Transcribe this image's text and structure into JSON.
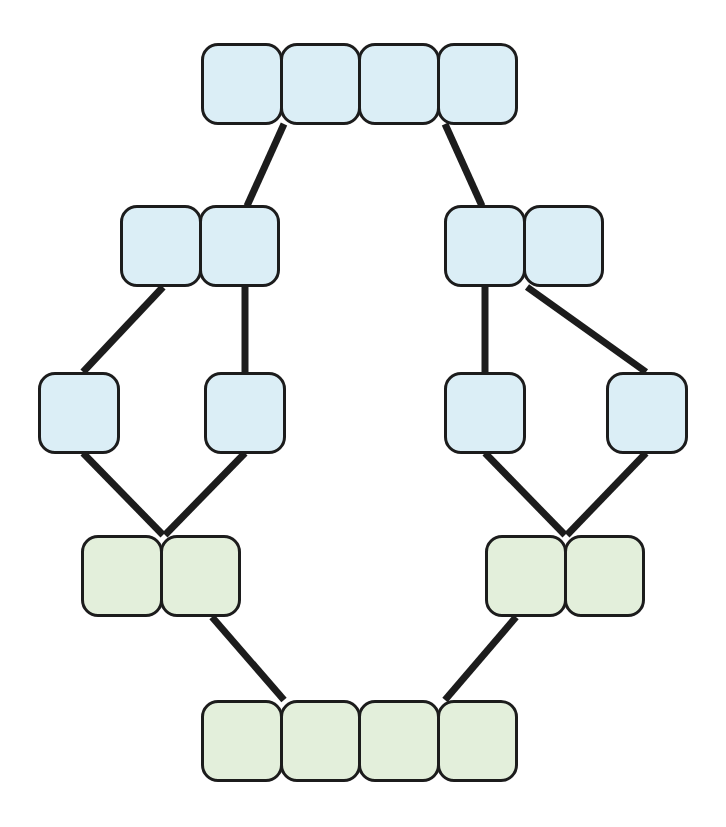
{
  "diagram": {
    "type": "lattice-hasse-diagram",
    "canvas": {
      "width": 726,
      "height": 827,
      "background": "#ffffff"
    },
    "style": {
      "cell_size": 82,
      "cell_radius": 17,
      "stroke_color": "#1c1c1c",
      "stroke_width": 3,
      "edge_color": "#1c1c1c",
      "edge_width": 7,
      "fill_blue": "#dbeef6",
      "fill_green": "#e3efdb"
    },
    "levels": [
      {
        "level": 1,
        "label": "top",
        "node_count": 1
      },
      {
        "level": 2,
        "label": "upper-middle",
        "node_count": 2
      },
      {
        "level": 3,
        "label": "middle",
        "node_count": 4
      },
      {
        "level": 4,
        "label": "lower-middle",
        "node_count": 2
      },
      {
        "level": 5,
        "label": "bottom",
        "node_count": 1
      }
    ],
    "nodes": [
      {
        "id": "n-top",
        "level": 1,
        "cells": 4,
        "color": "blue",
        "x": 201,
        "y": 43,
        "width": 326,
        "height": 82
      },
      {
        "id": "n-l2-left",
        "level": 2,
        "cells": 2,
        "color": "blue",
        "x": 120,
        "y": 205,
        "width": 163,
        "height": 82
      },
      {
        "id": "n-l2-right",
        "level": 2,
        "cells": 2,
        "color": "blue",
        "x": 444,
        "y": 205,
        "width": 163,
        "height": 82
      },
      {
        "id": "n-l3-a",
        "level": 3,
        "cells": 1,
        "color": "blue",
        "x": 38,
        "y": 372,
        "width": 82,
        "height": 82
      },
      {
        "id": "n-l3-b",
        "level": 3,
        "cells": 1,
        "color": "blue",
        "x": 204,
        "y": 372,
        "width": 82,
        "height": 82
      },
      {
        "id": "n-l3-c",
        "level": 3,
        "cells": 1,
        "color": "blue",
        "x": 444,
        "y": 372,
        "width": 82,
        "height": 82
      },
      {
        "id": "n-l3-d",
        "level": 3,
        "cells": 1,
        "color": "blue",
        "x": 606,
        "y": 372,
        "width": 82,
        "height": 82
      },
      {
        "id": "n-l4-left",
        "level": 4,
        "cells": 2,
        "color": "green",
        "x": 81,
        "y": 535,
        "width": 163,
        "height": 82
      },
      {
        "id": "n-l4-right",
        "level": 4,
        "cells": 2,
        "color": "green",
        "x": 485,
        "y": 535,
        "width": 163,
        "height": 82
      },
      {
        "id": "n-bottom",
        "level": 5,
        "cells": 4,
        "color": "green",
        "x": 201,
        "y": 700,
        "width": 326,
        "height": 82
      }
    ],
    "edges": [
      {
        "id": "e1",
        "from": "n-top",
        "to": "n-l2-left",
        "x1": 284,
        "y1": 124,
        "x2": 247,
        "y2": 206
      },
      {
        "id": "e2",
        "from": "n-top",
        "to": "n-l2-right",
        "x1": 445,
        "y1": 124,
        "x2": 482,
        "y2": 206
      },
      {
        "id": "e3",
        "from": "n-l2-left",
        "to": "n-l3-a",
        "x1": 163,
        "y1": 287,
        "x2": 83,
        "y2": 372
      },
      {
        "id": "e4",
        "from": "n-l2-left",
        "to": "n-l3-b",
        "x1": 245,
        "y1": 287,
        "x2": 245,
        "y2": 372
      },
      {
        "id": "e5",
        "from": "n-l2-right",
        "to": "n-l3-c",
        "x1": 485,
        "y1": 287,
        "x2": 485,
        "y2": 372
      },
      {
        "id": "e6",
        "from": "n-l2-right",
        "to": "n-l3-d",
        "x1": 527,
        "y1": 287,
        "x2": 646,
        "y2": 372
      },
      {
        "id": "e7",
        "from": "n-l3-a",
        "to": "n-l4-left",
        "x1": 83,
        "y1": 453,
        "x2": 163,
        "y2": 535
      },
      {
        "id": "e8",
        "from": "n-l3-b",
        "to": "n-l4-left",
        "x1": 245,
        "y1": 453,
        "x2": 165,
        "y2": 535
      },
      {
        "id": "e9",
        "from": "n-l3-c",
        "to": "n-l4-right",
        "x1": 485,
        "y1": 453,
        "x2": 565,
        "y2": 535
      },
      {
        "id": "e10",
        "from": "n-l3-d",
        "to": "n-l4-right",
        "x1": 646,
        "y1": 453,
        "x2": 567,
        "y2": 535
      },
      {
        "id": "e11",
        "from": "n-l4-left",
        "to": "n-bottom",
        "x1": 212,
        "y1": 617,
        "x2": 284,
        "y2": 700
      },
      {
        "id": "e12",
        "from": "n-l4-right",
        "to": "n-bottom",
        "x1": 516,
        "y1": 617,
        "x2": 445,
        "y2": 700
      }
    ]
  }
}
